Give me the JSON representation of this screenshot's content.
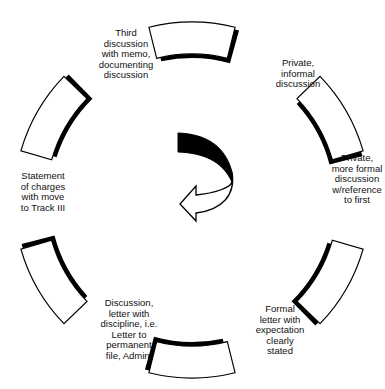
{
  "diagram": {
    "type": "cycle",
    "center": [
      192,
      200
    ],
    "outer_radius": 178,
    "inner_radius": 146,
    "segment_half_angle_deg": 14,
    "colors": {
      "stroke": "#000000",
      "fill": "#ffffff",
      "shadow": "#000000"
    },
    "segments": [
      {
        "id": "top",
        "angle": -90
      },
      {
        "id": "upper-right",
        "angle": -30
      },
      {
        "id": "lower-right",
        "angle": 30
      },
      {
        "id": "bottom",
        "angle": 90
      },
      {
        "id": "lower-left",
        "angle": 150
      },
      {
        "id": "upper-left",
        "angle": 210
      }
    ],
    "steps": [
      {
        "text": "Private,\ninformal\ndiscussion",
        "x": 258,
        "y": 58,
        "w": 80
      },
      {
        "text": "Private,\nmore formal\ndiscussion\nw/reference\nto first",
        "x": 322,
        "y": 153,
        "w": 70
      },
      {
        "text": "Formal\nletter with\nexpectation\nclearly\nstated",
        "x": 245,
        "y": 304,
        "w": 70
      },
      {
        "text": "Discussion,\nletter with\ndiscipline, i.e.\nLetter to\npermanent\nfile, Admin.",
        "x": 94,
        "y": 298,
        "w": 70
      },
      {
        "text": "Statement\nof charges\nwith move\nto Track III",
        "x": 18,
        "y": 171,
        "w": 50
      },
      {
        "text": "Third\ndiscussion\nwith memo,\ndocumenting\ndiscussion",
        "x": 96,
        "y": 28,
        "w": 60
      }
    ],
    "center_arrow": {
      "direction": "clockwise-curve-to-left",
      "head_fill": "#ffffff",
      "tail_fill": "#000000"
    }
  }
}
